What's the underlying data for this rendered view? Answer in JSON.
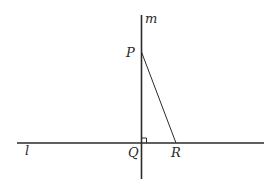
{
  "diagram": {
    "lines": [
      {
        "name": "l",
        "label": "l",
        "orientation": "horizontal"
      },
      {
        "name": "m",
        "label": "m",
        "orientation": "vertical"
      }
    ],
    "points": [
      {
        "name": "P",
        "label": "P",
        "on": "m"
      },
      {
        "name": "Q",
        "label": "Q",
        "on": [
          "l",
          "m"
        ],
        "right_angle": true
      },
      {
        "name": "R",
        "label": "R",
        "on": "l"
      }
    ],
    "segments": [
      {
        "from": "P",
        "to": "R"
      }
    ],
    "colors": {
      "stroke": "#2b2b2b",
      "background": "#ffffff"
    }
  }
}
